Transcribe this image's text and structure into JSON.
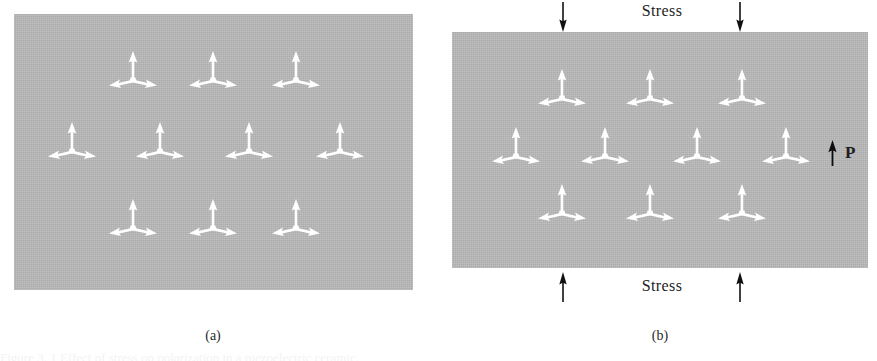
{
  "figure": {
    "panels": [
      {
        "id": "a",
        "caption": "(a)",
        "caption_x": 213,
        "caption_y": 328,
        "state": "unstressed",
        "rect": {
          "x": 14,
          "y": 14,
          "w": 399,
          "h": 276
        },
        "background_color": "#b8b8b8",
        "symbol_color": "#ffffff",
        "symbol_name": "tripod-arrow",
        "symbol_count": 10,
        "symbols": [
          {
            "x": 133,
            "y": 72,
            "rot": 0
          },
          {
            "x": 213,
            "y": 72,
            "rot": 0
          },
          {
            "x": 296,
            "y": 72,
            "rot": 0
          },
          {
            "x": 72,
            "y": 143,
            "rot": 0
          },
          {
            "x": 160,
            "y": 143,
            "rot": 0
          },
          {
            "x": 249,
            "y": 143,
            "rot": 0
          },
          {
            "x": 340,
            "y": 143,
            "rot": 0
          },
          {
            "x": 133,
            "y": 220,
            "rot": 0
          },
          {
            "x": 213,
            "y": 220,
            "rot": 0
          },
          {
            "x": 296,
            "y": 220,
            "rot": 0
          }
        ],
        "labels": []
      },
      {
        "id": "b",
        "caption": "(b)",
        "caption_x": 660,
        "caption_y": 328,
        "state": "stressed",
        "rect": {
          "x": 452,
          "y": 32,
          "w": 416,
          "h": 236
        },
        "background_color": "#b8b8b8",
        "symbol_color": "#ffffff",
        "symbol_name": "tripod-arrow",
        "symbol_count": 10,
        "symbols": [
          {
            "x": 562,
            "y": 90,
            "rot": 0
          },
          {
            "x": 650,
            "y": 90,
            "rot": 0
          },
          {
            "x": 742,
            "y": 90,
            "rot": 0
          },
          {
            "x": 516,
            "y": 148,
            "rot": 0
          },
          {
            "x": 605,
            "y": 148,
            "rot": 0
          },
          {
            "x": 697,
            "y": 148,
            "rot": 0
          },
          {
            "x": 786,
            "y": 148,
            "rot": 0
          },
          {
            "x": 562,
            "y": 205,
            "rot": 0
          },
          {
            "x": 650,
            "y": 205,
            "rot": 0
          },
          {
            "x": 742,
            "y": 205,
            "rot": 0
          }
        ],
        "labels": [
          {
            "name": "stress-label-top",
            "text": "Stress",
            "x": 662,
            "y": 2
          },
          {
            "name": "stress-label-bottom",
            "text": "Stress",
            "x": 662,
            "y": 277
          }
        ],
        "stress_arrows": [
          {
            "name": "stress-arrow-top-left",
            "x": 563,
            "y": 2,
            "direction": "down"
          },
          {
            "name": "stress-arrow-top-right",
            "x": 740,
            "y": 2,
            "direction": "down"
          },
          {
            "name": "stress-arrow-bottom-left",
            "x": 563,
            "y": 272,
            "direction": "up"
          },
          {
            "name": "stress-arrow-bottom-right",
            "x": 740,
            "y": 272,
            "direction": "up"
          }
        ],
        "polarization": {
          "name": "polarization-label",
          "text": "P",
          "arrow_direction": "up",
          "arrow_x": 826,
          "arrow_y": 140,
          "label_x": 845,
          "label_y": 143
        }
      }
    ],
    "bottom_caption": "Figure 3. 1  Effect of stress on polarization in a piezoelectric ceramic."
  }
}
